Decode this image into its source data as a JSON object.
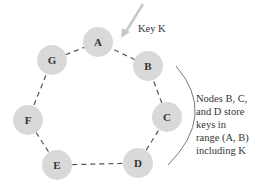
{
  "diagram": {
    "type": "consistent-hashing-ring",
    "colors": {
      "node_fill": "#d9d9d9",
      "ring_stroke": "#555555",
      "arrow": "#c8c8c8",
      "bracket": "#777777",
      "text": "#333333"
    },
    "nodes": [
      {
        "id": "A",
        "label": "A",
        "cx": 98,
        "cy": 42
      },
      {
        "id": "B",
        "label": "B",
        "cx": 148,
        "cy": 66
      },
      {
        "id": "C",
        "label": "C",
        "cx": 167,
        "cy": 117
      },
      {
        "id": "D",
        "label": "D",
        "cx": 138,
        "cy": 163
      },
      {
        "id": "E",
        "label": "E",
        "cx": 57,
        "cy": 165
      },
      {
        "id": "F",
        "label": "F",
        "cx": 28,
        "cy": 120
      },
      {
        "id": "G",
        "label": "G",
        "cx": 52,
        "cy": 60
      }
    ],
    "key_label": "Key K",
    "annotation_lines": [
      "Nodes B, C,",
      "and D store",
      "keys in",
      "range (A, B)",
      "including K"
    ]
  }
}
